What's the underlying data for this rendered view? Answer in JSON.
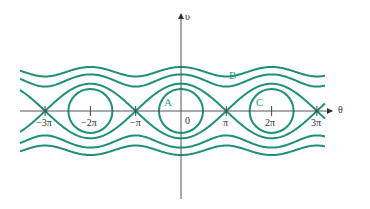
{
  "figure": {
    "axes": {
      "x_label": "θ",
      "y_label": "υ",
      "x_ticks": [
        "−3π",
        "−2π",
        "−π",
        "0",
        "π",
        "2π",
        "3π"
      ]
    },
    "points": {
      "A": "A",
      "B": "B",
      "C": "C"
    },
    "colors": {
      "curve": "#1f8f78",
      "axis": "#444444",
      "label": "#2a9d85"
    }
  }
}
